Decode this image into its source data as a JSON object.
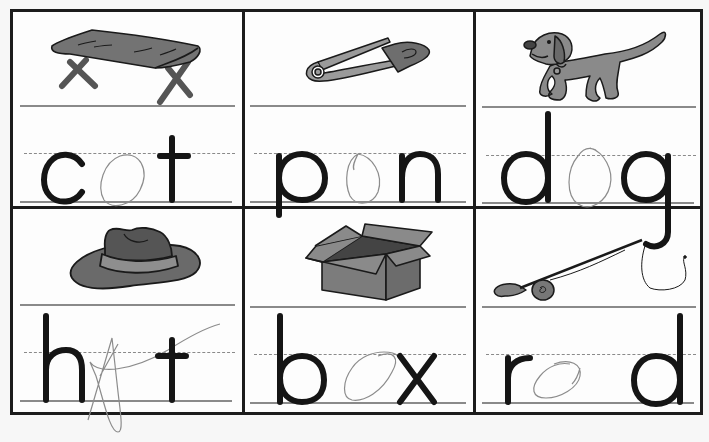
{
  "worksheet": {
    "cells": [
      {
        "picture": "cot-icon",
        "word": "cot",
        "letters": [
          "c",
          "",
          "t"
        ],
        "traced_letter": "o"
      },
      {
        "picture": "safety-pin-icon",
        "word": "pin",
        "letters": [
          "p",
          "",
          "n"
        ],
        "traced_letter": "o"
      },
      {
        "picture": "dog-icon",
        "word": "dog",
        "letters": [
          "d",
          "",
          "g"
        ],
        "traced_letter": "o"
      },
      {
        "picture": "hat-icon",
        "word": "hat",
        "letters": [
          "h",
          "",
          "t"
        ],
        "traced_letter": "A"
      },
      {
        "picture": "box-icon",
        "word": "box",
        "letters": [
          "b",
          "",
          "x"
        ],
        "traced_letter": "o"
      },
      {
        "picture": "fishing-rod-icon",
        "word": "rod",
        "letters": [
          "r",
          "",
          "d"
        ],
        "traced_letter": "o"
      }
    ]
  },
  "colors": {
    "ink": "#151515",
    "border": "#1c1c1c",
    "rule": "#8a8a8a",
    "pencil": "#8c8c8c",
    "picture_fill": "#7a7a7a",
    "picture_fill_light": "#9a9a9a",
    "paper": "#fdfdfd"
  }
}
